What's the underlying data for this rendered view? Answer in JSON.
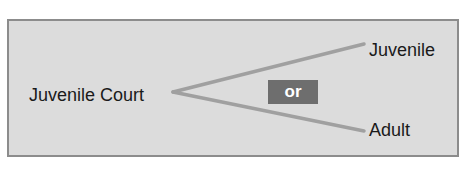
{
  "diagram": {
    "source": {
      "label": "Juvenile Court"
    },
    "branches": [
      {
        "label": "Juvenile"
      },
      {
        "label": "Adult"
      }
    ],
    "connector": {
      "label": "or"
    }
  },
  "colors": {
    "panel_bg": "#dcdcdc",
    "panel_border": "#8c8c8c",
    "line": "#a0a0a0",
    "connector_bg": "#6e6e6e",
    "connector_text": "#ffffff",
    "text": "#1a1a1a"
  }
}
